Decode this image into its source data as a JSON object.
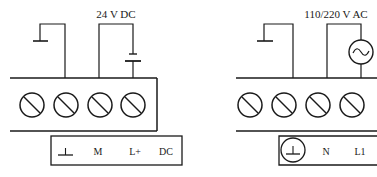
{
  "left_diagram": {
    "supply_label": "24 V DC",
    "terminals": [
      {
        "label": "⊥",
        "icon": "ground-icon"
      },
      {
        "label": "M"
      },
      {
        "label": "L+"
      },
      {
        "label": "DC"
      }
    ],
    "source_icon": "battery-icon"
  },
  "right_diagram": {
    "supply_label": "110/220 V AC",
    "terminals": [
      {
        "label": "⊥",
        "icon": "protective-earth-icon"
      },
      {
        "label": "N"
      },
      {
        "label": "L1"
      }
    ],
    "source_icon": "ac-source-icon"
  },
  "colors": {
    "line": "#1a1a1a",
    "background": "#ffffff"
  }
}
